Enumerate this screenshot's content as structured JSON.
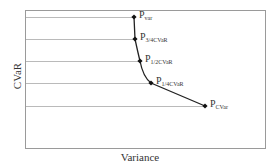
{
  "chart_data": {
    "type": "line",
    "title": "",
    "xlabel": "Variance",
    "ylabel": "CVaR",
    "grid": "horizontal reference lines from y-axis to each point",
    "legend": null,
    "points": [
      {
        "label_main": "P",
        "label_sub": "var",
        "x": 134,
        "y": 17
      },
      {
        "label_main": "P",
        "label_sub": "3/4CVaR",
        "x": 135,
        "y": 39
      },
      {
        "label_main": "P",
        "label_sub": "1/2CVaR",
        "x": 140,
        "y": 61
      },
      {
        "label_main": "P",
        "label_sub": "1/4CVaR",
        "x": 151,
        "y": 83
      },
      {
        "label_main": "P",
        "label_sub": "CVar",
        "x": 205,
        "y": 106
      }
    ],
    "frame": {
      "left": 25,
      "top": 10,
      "right": 265,
      "bottom": 148
    },
    "colors": {
      "frame": "#9a9a9a",
      "grid": "#a8a8a8",
      "curve": "#222222",
      "marker": "#111111",
      "text": "#333333"
    }
  }
}
